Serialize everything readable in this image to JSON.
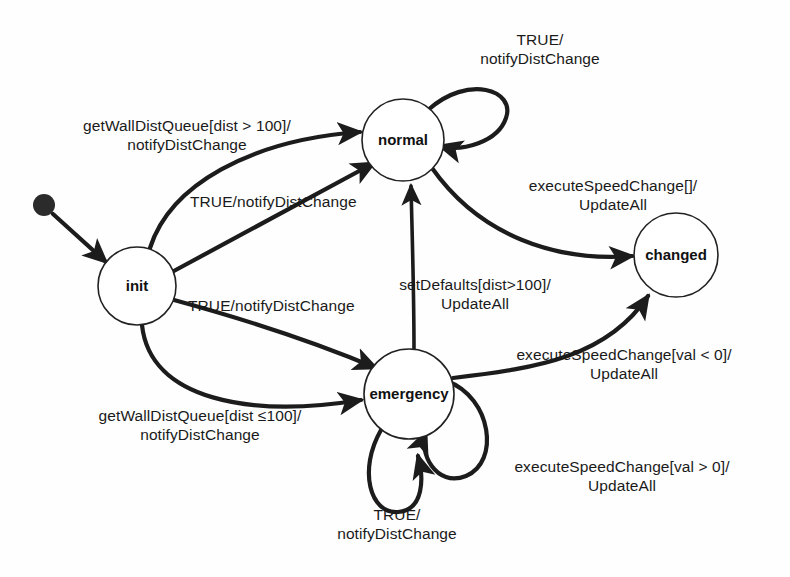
{
  "diagram": {
    "type": "state-machine",
    "title": "",
    "background_color": "#ffffff",
    "stroke_color": "#1c1c1c"
  },
  "states": [
    {
      "id": "init",
      "label": "init",
      "cx": 137,
      "cy": 286,
      "r": 39
    },
    {
      "id": "normal",
      "label": "normal",
      "cx": 403,
      "cy": 140,
      "r": 41
    },
    {
      "id": "emergency",
      "label": "emergency",
      "cx": 409,
      "cy": 394,
      "r": 45
    },
    {
      "id": "changed",
      "label": "changed",
      "cx": 676,
      "cy": 255,
      "r": 42
    }
  ],
  "initial_marker": {
    "id": "start",
    "cx": 44,
    "cy": 205,
    "r": 11
  },
  "transitions": [
    {
      "id": "start-to-init",
      "from": "start",
      "to": "init",
      "label": ""
    },
    {
      "id": "init-to-normal-getwalldist",
      "from": "init",
      "to": "normal",
      "trigger": "getWallDistQueue[dist > 100]",
      "action": "notifyDistChange",
      "label_line1": "getWallDistQueue[dist > 100]/",
      "label_line2": "notifyDistChange"
    },
    {
      "id": "init-to-normal-true",
      "from": "init",
      "to": "normal",
      "trigger": "TRUE",
      "action": "notifyDistChange",
      "label_line1": "TRUE/notifyDistChange",
      "label_line2": ""
    },
    {
      "id": "init-to-emergency-true",
      "from": "init",
      "to": "emergency",
      "trigger": "TRUE",
      "action": "notifyDistChange",
      "label_line1": "TRUE/notifyDistChange",
      "label_line2": ""
    },
    {
      "id": "init-to-emergency-getwalldist",
      "from": "init",
      "to": "emergency",
      "trigger": "getWallDistQueue[dist ≤100]",
      "action": "notifyDistChange",
      "label_line1": "getWallDistQueue[dist ≤100]/",
      "label_line2": "notifyDistChange"
    },
    {
      "id": "normal-self-loop",
      "from": "normal",
      "to": "normal",
      "trigger": "TRUE",
      "action": "notifyDistChange",
      "label_line1": "TRUE/",
      "label_line2": "notifyDistChange"
    },
    {
      "id": "normal-to-changed",
      "from": "normal",
      "to": "changed",
      "trigger": "executeSpeedChange[]",
      "action": "UpdateAll",
      "label_line1": "executeSpeedChange[]/",
      "label_line2": "UpdateAll"
    },
    {
      "id": "emergency-to-normal",
      "from": "emergency",
      "to": "normal",
      "trigger": "setDefaults[dist>100]",
      "action": "UpdateAll",
      "label_line1": "setDefaults[dist>100]/",
      "label_line2": "UpdateAll"
    },
    {
      "id": "emergency-to-changed",
      "from": "emergency",
      "to": "changed",
      "trigger": "executeSpeedChange[val < 0]",
      "action": "UpdateAll",
      "label_line1": "executeSpeedChange[val < 0]/",
      "label_line2": "UpdateAll"
    },
    {
      "id": "emergency-self-loop-right",
      "from": "emergency",
      "to": "emergency",
      "trigger": "executeSpeedChange[val > 0]",
      "action": "UpdateAll",
      "label_line1": "executeSpeedChange[val > 0]/",
      "label_line2": "UpdateAll"
    },
    {
      "id": "emergency-self-loop-bottom",
      "from": "emergency",
      "to": "emergency",
      "trigger": "TRUE",
      "action": "notifyDistChange",
      "label_line1": "TRUE/",
      "label_line2": "notifyDistChange"
    }
  ]
}
